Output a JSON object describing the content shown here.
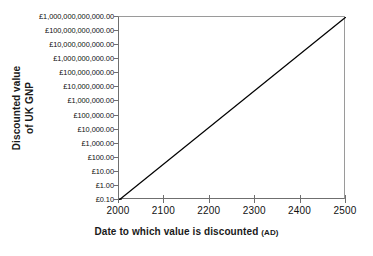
{
  "chart_data": {
    "type": "line",
    "title": "",
    "subtitle": "",
    "xlabel": "Date to which value is discounted",
    "xlabel_suffix": "(AD)",
    "ylabel_line1": "Discounted value",
    "ylabel_line2": "of UK GNP",
    "x": [
      2000,
      2500
    ],
    "values": [
      0.1,
      1000000000000
    ],
    "series": [
      {
        "name": "Discounted value of UK GNP",
        "x": [
          2000,
          2500
        ],
        "values": [
          0.1,
          1000000000000
        ]
      }
    ],
    "xlim": [
      2000,
      2500
    ],
    "ylim": [
      0.1,
      1000000000000
    ],
    "yscale": "log",
    "xscale": "linear",
    "grid": false,
    "legend": false,
    "legend_position": "none",
    "line_color": "#000000",
    "xticks": [
      2000,
      2100,
      2200,
      2300,
      2400,
      2500
    ],
    "xtick_labels": [
      "2000",
      "2100",
      "2200",
      "2300",
      "2400",
      "2500"
    ],
    "ytick_values": [
      0.1,
      1,
      10,
      100,
      1000,
      10000,
      100000,
      1000000,
      10000000,
      100000000,
      1000000000,
      10000000000,
      100000000000,
      1000000000000
    ],
    "ytick_labels": [
      "£0.10",
      "£1.00",
      "£10.00",
      "£100.00",
      "£1,000.00",
      "£10,000.00",
      "£100,000.00",
      "£1,000,000.00",
      "£10,000,000.00",
      "£100,000,000.00",
      "£1,000,000,000.00",
      "£10,000,000,000.00",
      "£100,000,000,000.00",
      "£1,000,000,000,000.00"
    ],
    "annotations": []
  }
}
